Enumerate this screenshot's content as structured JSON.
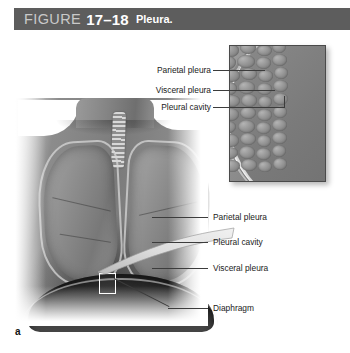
{
  "figure": {
    "header": {
      "figure_word": "FIGURE",
      "number": "17–18",
      "caption": "Pleura.",
      "bar_color": "#5d5d5d",
      "figure_word_color": "#c9c9c9",
      "text_color": "#ffffff"
    },
    "panel_letter": "a",
    "inset_labels": [
      {
        "text": "Parietal pleura",
        "id": "inset-label-parietal-pleura"
      },
      {
        "text": "Visceral pleura",
        "id": "inset-label-visceral-pleura"
      },
      {
        "text": "Pleural cavity",
        "id": "inset-label-pleural-cavity"
      }
    ],
    "main_labels": [
      {
        "text": "Parietal pleura",
        "id": "main-label-parietal-pleura"
      },
      {
        "text": "Pleural cavity",
        "id": "main-label-pleural-cavity"
      },
      {
        "text": "Visceral pleura",
        "id": "main-label-visceral-pleura"
      },
      {
        "text": "Diaphragm",
        "id": "main-label-diaphragm"
      }
    ],
    "illustration": {
      "subject": "anterior view of thorax showing lungs, trachea and diaphragm",
      "inset": "magnified detail of pleural membranes at the lung surface",
      "line_color": "#3c3c3c",
      "label_color": "#1a1a1a"
    }
  }
}
